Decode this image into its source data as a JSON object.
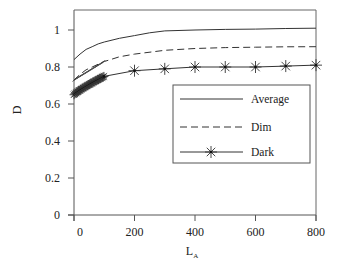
{
  "chart_data": {
    "type": "line",
    "title": "",
    "xlabel": "L",
    "xlabel_subscript": "A",
    "ylabel": "D",
    "xlim": [
      0,
      800
    ],
    "ylim": [
      0,
      1.1
    ],
    "xticks": [
      0,
      200,
      400,
      600,
      800
    ],
    "xtick_labels": [
      "0",
      "200",
      "400",
      "600",
      "800"
    ],
    "yticks": [
      0,
      0.2,
      0.4,
      0.6,
      0.8,
      1
    ],
    "ytick_labels": [
      "0",
      "0.2",
      "0.4",
      "0.6",
      "0.8",
      "1"
    ],
    "grid": false,
    "legend_position": "center-right",
    "series": [
      {
        "name": "Average",
        "style": "solid",
        "marker": "none",
        "x": [
          0,
          20,
          40,
          60,
          80,
          100,
          150,
          200,
          250,
          300,
          400,
          500,
          600,
          700,
          800
        ],
        "values": [
          0.84,
          0.87,
          0.895,
          0.91,
          0.925,
          0.935,
          0.955,
          0.97,
          0.985,
          0.995,
          1.0,
          1.003,
          1.005,
          1.008,
          1.01
        ]
      },
      {
        "name": "Dim",
        "style": "dashed",
        "marker": "none",
        "x": [
          0,
          20,
          40,
          60,
          80,
          100,
          150,
          200,
          300,
          400,
          500,
          600,
          700,
          800
        ],
        "values": [
          0.73,
          0.76,
          0.785,
          0.8,
          0.815,
          0.83,
          0.855,
          0.87,
          0.89,
          0.9,
          0.905,
          0.907,
          0.909,
          0.91
        ]
      },
      {
        "name": "Dark",
        "style": "solid",
        "marker": "asterisk",
        "x": [
          0,
          10,
          20,
          30,
          40,
          50,
          60,
          70,
          80,
          90,
          100,
          200,
          300,
          400,
          500,
          600,
          700,
          800
        ],
        "values": [
          0.65,
          0.665,
          0.68,
          0.69,
          0.7,
          0.71,
          0.72,
          0.73,
          0.735,
          0.74,
          0.75,
          0.78,
          0.79,
          0.8,
          0.8,
          0.8,
          0.805,
          0.81
        ]
      }
    ]
  },
  "legend": {
    "items": [
      {
        "label": "Average"
      },
      {
        "label": "Dim"
      },
      {
        "label": "Dark"
      }
    ]
  },
  "colors": {
    "line": "#333333",
    "axis": "#555555"
  }
}
